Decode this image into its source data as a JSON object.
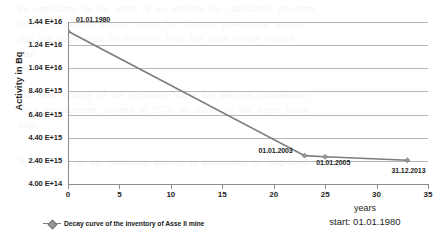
{
  "chart_data": {
    "type": "line",
    "title": "",
    "xlabel": "years",
    "ylabel": "Activity in Bq",
    "xlim": [
      0,
      35
    ],
    "ylim": [
      400000000000000,
      14400000000000000
    ],
    "grid": true,
    "legend_position": "bottom-left",
    "x_ticks": [
      "0",
      "5",
      "10",
      "15",
      "20",
      "25",
      "30",
      "35"
    ],
    "x_tick_values": [
      0,
      5,
      10,
      15,
      20,
      25,
      30,
      35
    ],
    "y_ticks": [
      "1.44 E+16",
      "1.24 E+16",
      "1.04 E+16",
      "8.40 E+15",
      "6.40 E+15",
      "4.40 E+15",
      "2.40 E+15",
      "4.00 E+14"
    ],
    "y_tick_values": [
      14400000000000000,
      12400000000000000,
      10400000000000000,
      8400000000000000,
      6400000000000000,
      4400000000000000,
      2400000000000000,
      400000000000000
    ],
    "series": [
      {
        "name": "Decay curve of the inventory of Asse II mine",
        "color": "#7d7d7d",
        "marker": "diamond",
        "x": [
          0,
          23,
          25,
          33
        ],
        "y": [
          13600000000000000,
          2850000000000000,
          2750000000000000,
          2450000000000000
        ],
        "point_labels": [
          "01.01.1980",
          "01.01.2003",
          "01.01.2005",
          "31.12.2013"
        ]
      }
    ],
    "annotations": [
      {
        "text": "years",
        "role": "x-axis-title"
      },
      {
        "text": "start: 01.01.1980",
        "role": "start-note"
      }
    ]
  },
  "legend": {
    "entries": [
      {
        "label": "Decay curve of the inventory of Asse II mine"
      }
    ]
  },
  "footer": {
    "years_label": "years",
    "start_label": "start: 01.01.1980"
  },
  "background_text": [
    "the repository. In the event of an accident the radioactive inventory",
    "could contaminate ground water. The German government decided",
    "that the waste must be retrieved from the mine before closure.",
    "plan.",
    "The total activity of the emplaced waste has decayed considerably",
    "since emplacement stopped in 1978, as shown in the figure below.",
    "mine.",
    "A large part of the remaining activity is attributable to long-lived"
  ]
}
